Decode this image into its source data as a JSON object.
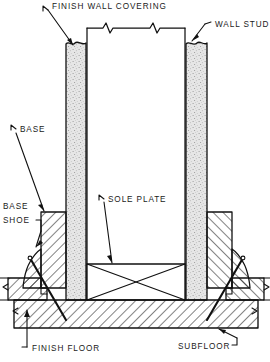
{
  "diagram": {
    "type": "architectural-section",
    "labels": {
      "finish_wall_covering": "FINISH WALL COVERING",
      "wall_stud": "WALL STUD",
      "base": "BASE",
      "base_shoe_line1": "BASE",
      "base_shoe_line2": "SHOE",
      "sole_plate": "SOLE PLATE",
      "finish_floor": "FINISH FLOOR",
      "subfloor": "SUBFLOOR"
    },
    "components": [
      {
        "name": "finish-wall-covering",
        "label": "FINISH WALL COVERING",
        "fill": "stipple"
      },
      {
        "name": "wall-stud",
        "label": "WALL STUD",
        "fill": "stipple"
      },
      {
        "name": "base",
        "label": "BASE",
        "fill": "hatch"
      },
      {
        "name": "base-shoe",
        "label": "BASE SHOE",
        "fill": "hatch"
      },
      {
        "name": "sole-plate",
        "label": "SOLE PLATE",
        "fill": "end-grain-cross"
      },
      {
        "name": "finish-floor",
        "label": "FINISH FLOOR",
        "fill": "hatch"
      },
      {
        "name": "subfloor",
        "label": "SUBFLOOR",
        "fill": "hatch"
      }
    ],
    "colors": {
      "line": "#111111",
      "background": "#ffffff",
      "stipple_fill": "#e3e3e3",
      "hatch_line": "#111111"
    }
  }
}
